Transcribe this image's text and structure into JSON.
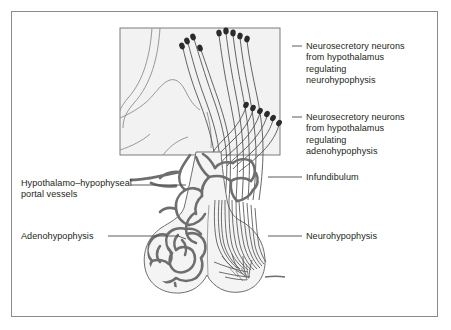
{
  "figure": {
    "border_color": "#8a8a8a",
    "background_color": "#ffffff",
    "ink_color": "#231f20",
    "vessel_color": "#6e6e6e",
    "tissue_fill": "#f4f4f4",
    "hypothalamus_fill": "#f2f2f2"
  },
  "labels": {
    "neurosecretory_neurohypophysis": "Neurosecretory neurons\nfrom hypothalamus\nregulating\nneurohypophysis",
    "neurosecretory_adenohypophysis": "Neurosecretory neurons\nfrom hypothalamus\nregulating\nadenohypophysis",
    "infundibulum": "Infundibulum",
    "neurohypophysis": "Neurohypophysis",
    "portal_vessels": "Hypothalamo–hypophyseal\nportal vessels",
    "adenohypophysis": "Adenohypophysis"
  },
  "structures": {
    "hypothalamus": "hypothalamus-block",
    "neuron_cluster_upper": "neurosecretory-neuron-cluster-upper",
    "neuron_cluster_lower": "neurosecretory-neuron-cluster-lower",
    "axon_bundle": "axon-bundle",
    "portal_plexus": "portal-vessel-plexus",
    "pituitary_anterior": "adenohypophysis-lobe",
    "pituitary_posterior": "neurohypophysis-lobe",
    "capillary_tree": "neurohypophysis-capillary-tree",
    "hypophyseal_artery": "superior-hypophyseal-artery"
  }
}
